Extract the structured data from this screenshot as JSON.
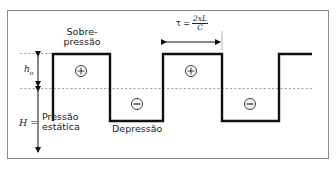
{
  "diagram": {
    "type": "pressure-wave-square-diagram",
    "labels": {
      "overpressure_line1": "Sobre-",
      "overpressure_line2": "pressão",
      "h0_symbol": "h",
      "h0_subscript": "o",
      "H_label": "H =",
      "static_line1": "Pressão",
      "static_line2": "estática",
      "depression": "Depressão",
      "tau_lhs": "τ =",
      "tau_numerator": "2xL",
      "tau_denominator": "C",
      "plus_symbol": "+",
      "minus_symbol": "−"
    },
    "colors": {
      "wave": "#111111",
      "frame": "#888888",
      "dashed": "#999999",
      "text": "#222222"
    }
  }
}
